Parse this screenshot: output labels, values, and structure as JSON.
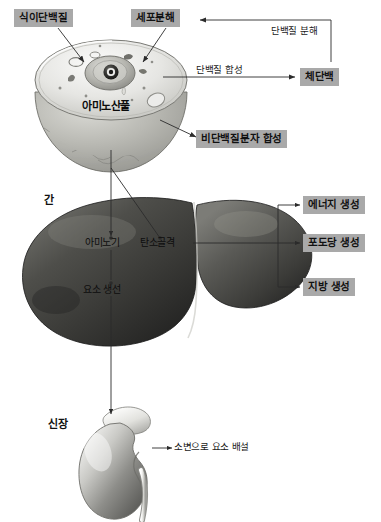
{
  "diagram": {
    "boxes": {
      "dietary_protein": "식이단백질",
      "cell_breakdown": "세포분해",
      "body_protein": "체단백",
      "nonprotein_synthesis": "비단백질분자 합성",
      "energy_production": "에너지 생성",
      "glucose_production": "포도당 생성",
      "fat_production": "지방 생성"
    },
    "edge_labels": {
      "protein_degradation": "단백질 분해",
      "protein_synthesis": "단백질 합성",
      "urea_excretion": "소변으로 요소 배설"
    },
    "organ_labels": {
      "liver": "간",
      "kidney": "신장"
    },
    "inline_labels": {
      "amino_acid_pool": "아미노산풀",
      "amino_group": "아미노기",
      "urea_formation": "요소 생선",
      "carbon_skeleton": "탄소골격"
    },
    "colors": {
      "box_fill": "#a9a9a9",
      "text": "#111111",
      "line": "#2b2b2b",
      "background": "#ffffff"
    }
  }
}
